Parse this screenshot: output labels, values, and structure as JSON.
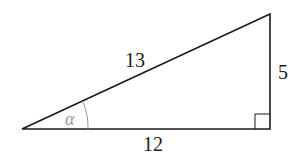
{
  "diagram": {
    "type": "right-triangle",
    "sides": {
      "hypotenuse": "13",
      "base": "12",
      "height": "5"
    },
    "angle_label": "α",
    "right_angle_marker": true,
    "colors": {
      "stroke": "#1a1a1a",
      "angle_arc": "#9a9a9a",
      "angle_label": "#9a9a9a",
      "background": "#ffffff"
    }
  }
}
